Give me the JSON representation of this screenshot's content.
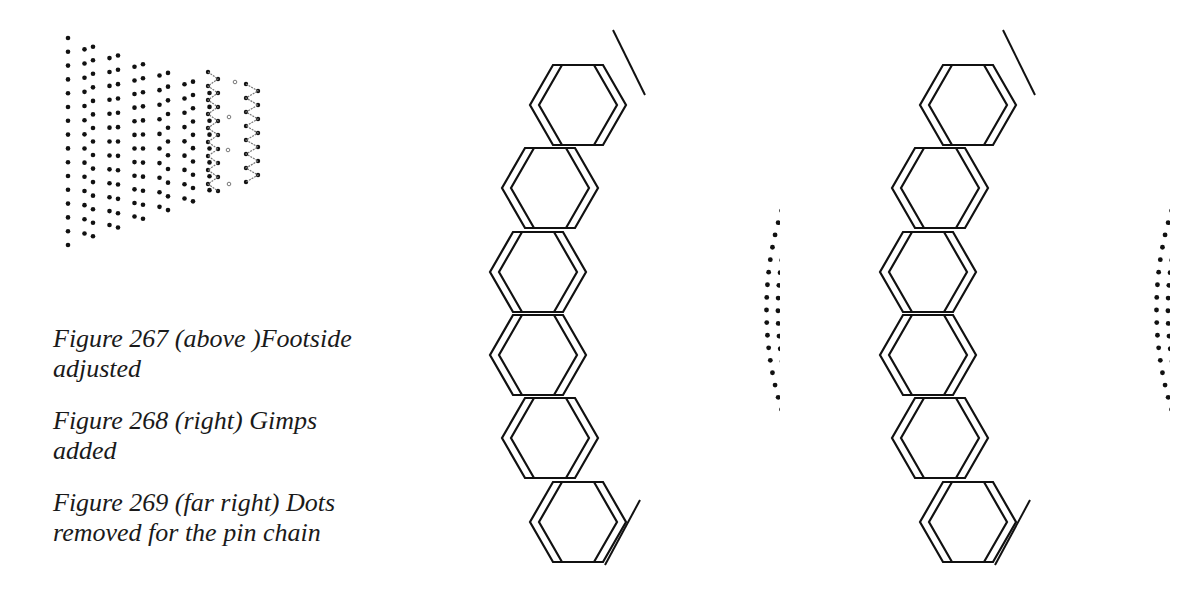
{
  "figures": [
    {
      "id": "267",
      "caption": "Figure 267 (above )Footside adjusted",
      "caption_lines": [
        "Figure 267 (above )Footside",
        "adjusted"
      ]
    },
    {
      "id": "268",
      "caption": "Figure 268 (right) Gimps added",
      "caption_lines": [
        "Figure 268 (right) Gimps added"
      ]
    },
    {
      "id": "269",
      "caption": "Figure 269 (far right) Dots removed for the pin chain",
      "caption_lines": [
        "Figure 269 (far right) Dots",
        "removed for the pin chain"
      ]
    }
  ],
  "colors": {
    "ink": "#111111",
    "pin_chain": "#777777",
    "background": "#ffffff"
  }
}
